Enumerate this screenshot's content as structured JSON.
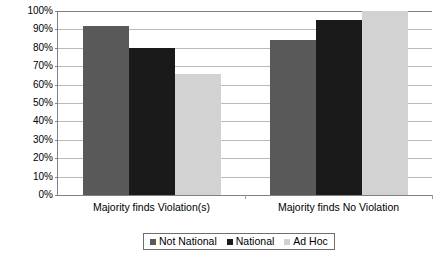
{
  "chart_data": {
    "type": "bar",
    "title": "",
    "subtitle": "",
    "xlabel": "",
    "ylabel": "",
    "categories": [
      "Majority finds Violation(s)",
      "Majority finds No Violation"
    ],
    "series": [
      {
        "name": "Not National",
        "color": "#595959",
        "values": [
          92,
          84
        ]
      },
      {
        "name": "National",
        "color": "#1a1a1a",
        "values": [
          80,
          95
        ]
      },
      {
        "name": "Ad Hoc",
        "color": "#d2d2d2",
        "values": [
          66,
          100
        ]
      }
    ],
    "series_by_group": [
      {
        "category": "Majority finds Violation(s)",
        "Not National": 92,
        "National": 84,
        "Ad Hoc": 66
      },
      {
        "category": "Majority finds No Violation",
        "Not National": 80,
        "National": 95,
        "Ad Hoc": 100
      }
    ],
    "ylim": [
      0,
      100
    ],
    "ytick_values": [
      0,
      10,
      20,
      30,
      40,
      50,
      60,
      70,
      80,
      90,
      100
    ],
    "ytick_labels": [
      "0%",
      "10%",
      "20%",
      "30%",
      "40%",
      "50%",
      "60%",
      "70%",
      "80%",
      "90%",
      "100%"
    ],
    "grid": true,
    "grid_axis": "y",
    "legend_position": "bottom",
    "legend_entries": [
      "Not National",
      "National",
      "Ad Hoc"
    ],
    "annotations": []
  },
  "axis": {
    "y_ticks": [
      {
        "label": "100%",
        "value": 100
      },
      {
        "label": "90%",
        "value": 90
      },
      {
        "label": "80%",
        "value": 80
      },
      {
        "label": "70%",
        "value": 70
      },
      {
        "label": "60%",
        "value": 60
      },
      {
        "label": "50%",
        "value": 50
      },
      {
        "label": "40%",
        "value": 40
      },
      {
        "label": "30%",
        "value": 30
      },
      {
        "label": "20%",
        "value": 20
      },
      {
        "label": "10%",
        "value": 10
      },
      {
        "label": "0%",
        "value": 0
      }
    ],
    "x_labels": [
      "Majority finds Violation(s)",
      "Majority finds No Violation"
    ]
  },
  "legend": {
    "items": [
      {
        "label": "Not National",
        "color": "#595959"
      },
      {
        "label": "National",
        "color": "#1a1a1a"
      },
      {
        "label": "Ad Hoc",
        "color": "#d2d2d2"
      }
    ]
  }
}
